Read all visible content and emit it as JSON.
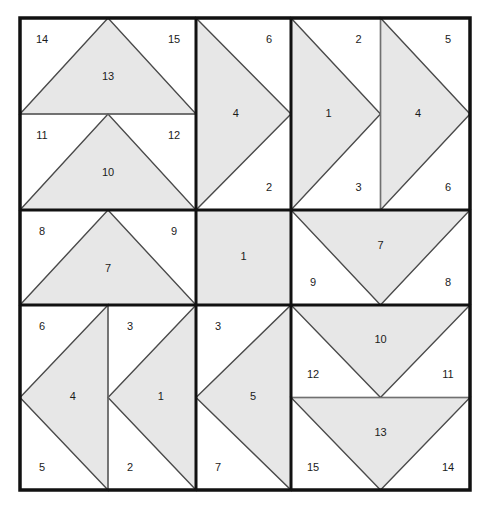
{
  "figure": {
    "type": "geometric-diagram",
    "canvas": {
      "width": 489,
      "height": 510
    },
    "colors": {
      "background": "#ffffff",
      "shape_fill": "#e7e7e7",
      "shape_stroke": "#4a4a4a",
      "outer_border": "#111111",
      "inner_border": "#111111",
      "thin_divider": "#707070",
      "label_color": "#1b1b1b"
    },
    "geometry": {
      "outer": {
        "x": 20,
        "y": 18,
        "width": 450,
        "height": 472
      },
      "col_edges": [
        20,
        196,
        291,
        470
      ],
      "row_edges": [
        18,
        210,
        305,
        490
      ],
      "outer_stroke_width": 3.5,
      "inner_stroke_width": 3.0,
      "thin_stroke_width": 1.2,
      "shape_stroke_width": 1.4
    },
    "cells": [
      {
        "id": "cell-r0c0",
        "name": "top-left",
        "split": "horizontal",
        "parts": [
          {
            "id": "r0c0-a",
            "shape": "triangle-up",
            "shape_label": "13",
            "corner_labels": [
              {
                "text": "14",
                "pos": "top-left"
              },
              {
                "text": "15",
                "pos": "top-right"
              }
            ]
          },
          {
            "id": "r0c0-b",
            "shape": "triangle-up",
            "shape_label": "10",
            "corner_labels": [
              {
                "text": "11",
                "pos": "top-left"
              },
              {
                "text": "12",
                "pos": "top-right"
              }
            ]
          }
        ]
      },
      {
        "id": "cell-r0c1",
        "name": "top-center",
        "split": "none",
        "parts": [
          {
            "id": "r0c1-a",
            "shape": "triangle-right",
            "shape_label": "4",
            "corner_labels": [
              {
                "text": "6",
                "pos": "top-right"
              },
              {
                "text": "2",
                "pos": "bottom-right"
              }
            ]
          }
        ]
      },
      {
        "id": "cell-r0c2",
        "name": "top-right",
        "split": "vertical",
        "parts": [
          {
            "id": "r0c2-a",
            "shape": "triangle-right",
            "shape_label": "1",
            "corner_labels": [
              {
                "text": "2",
                "pos": "top-right"
              },
              {
                "text": "3",
                "pos": "bottom-right"
              }
            ]
          },
          {
            "id": "r0c2-b",
            "shape": "triangle-right",
            "shape_label": "4",
            "corner_labels": [
              {
                "text": "5",
                "pos": "top-right"
              },
              {
                "text": "6",
                "pos": "bottom-right"
              }
            ]
          }
        ]
      },
      {
        "id": "cell-r1c0",
        "name": "middle-left",
        "split": "none",
        "parts": [
          {
            "id": "r1c0-a",
            "shape": "triangle-up",
            "shape_label": "7",
            "corner_labels": [
              {
                "text": "8",
                "pos": "top-left"
              },
              {
                "text": "9",
                "pos": "top-right"
              }
            ]
          }
        ]
      },
      {
        "id": "cell-r1c1",
        "name": "middle-center",
        "split": "none",
        "parts": [
          {
            "id": "r1c1-a",
            "shape": "square",
            "shape_label": "1",
            "corner_labels": []
          }
        ]
      },
      {
        "id": "cell-r1c2",
        "name": "middle-right",
        "split": "none",
        "parts": [
          {
            "id": "r1c2-a",
            "shape": "triangle-down",
            "shape_label": "7",
            "corner_labels": [
              {
                "text": "9",
                "pos": "bottom-left"
              },
              {
                "text": "8",
                "pos": "bottom-right"
              }
            ]
          }
        ]
      },
      {
        "id": "cell-r2c0",
        "name": "bottom-left",
        "split": "vertical",
        "parts": [
          {
            "id": "r2c0-a",
            "shape": "triangle-left",
            "shape_label": "4",
            "corner_labels": [
              {
                "text": "6",
                "pos": "top-left"
              },
              {
                "text": "5",
                "pos": "bottom-left"
              }
            ]
          },
          {
            "id": "r2c0-b",
            "shape": "triangle-left",
            "shape_label": "1",
            "corner_labels": [
              {
                "text": "3",
                "pos": "top-left"
              },
              {
                "text": "2",
                "pos": "bottom-left"
              }
            ]
          }
        ]
      },
      {
        "id": "cell-r2c1",
        "name": "bottom-center",
        "split": "none",
        "parts": [
          {
            "id": "r2c1-a",
            "shape": "triangle-left",
            "shape_label": "5",
            "corner_labels": [
              {
                "text": "3",
                "pos": "top-left"
              },
              {
                "text": "7",
                "pos": "bottom-left"
              }
            ]
          }
        ]
      },
      {
        "id": "cell-r2c2",
        "name": "bottom-right",
        "split": "horizontal",
        "parts": [
          {
            "id": "r2c2-a",
            "shape": "triangle-down",
            "shape_label": "10",
            "corner_labels": [
              {
                "text": "12",
                "pos": "bottom-left"
              },
              {
                "text": "11",
                "pos": "bottom-right"
              }
            ]
          },
          {
            "id": "r2c2-b",
            "shape": "triangle-down",
            "shape_label": "13",
            "corner_labels": [
              {
                "text": "15",
                "pos": "bottom-left"
              },
              {
                "text": "14",
                "pos": "bottom-right"
              }
            ]
          }
        ]
      }
    ]
  }
}
